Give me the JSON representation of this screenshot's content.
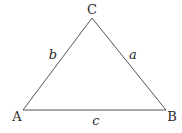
{
  "diagram": {
    "type": "triangle",
    "vertices": [
      {
        "name": "A",
        "x": 23,
        "y": 110,
        "label_x": 17,
        "label_y": 121
      },
      {
        "name": "B",
        "x": 166,
        "y": 110,
        "label_x": 172,
        "label_y": 121
      },
      {
        "name": "C",
        "x": 92,
        "y": 18,
        "label_x": 92,
        "label_y": 14
      }
    ],
    "sides": [
      {
        "name": "a",
        "label_x": 133,
        "label_y": 59
      },
      {
        "name": "b",
        "label_x": 53,
        "label_y": 59
      },
      {
        "name": "c",
        "label_x": 96,
        "label_y": 125
      }
    ],
    "stroke_color": "#555555"
  }
}
